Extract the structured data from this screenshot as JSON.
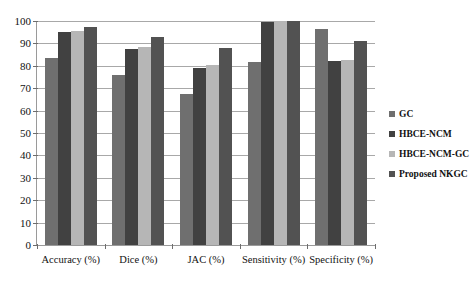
{
  "chart_data": {
    "type": "bar",
    "title": "",
    "subtitle": "",
    "xlabel": "",
    "ylabel": "",
    "ylim": [
      0,
      100
    ],
    "ytick_step": 10,
    "yticks": [
      100,
      90,
      80,
      70,
      60,
      50,
      40,
      30,
      20,
      10,
      0
    ],
    "grid": true,
    "legend_position": "right",
    "categories": [
      "Accuracy (%)",
      "Dice (%)",
      "JAC (%)",
      "Sensitivity (%)",
      "Specificity (%)"
    ],
    "series": [
      {
        "name": "GC",
        "color": "#6f6f6f",
        "values": [
          83.5,
          76.0,
          67.5,
          81.5,
          96.5
        ]
      },
      {
        "name": "HBCE-NCM",
        "color": "#414141",
        "values": [
          95.0,
          87.5,
          79.0,
          99.5,
          82.0
        ]
      },
      {
        "name": "HBCE-NCM-GC",
        "color": "#b6b6b6",
        "values": [
          95.5,
          88.5,
          80.5,
          99.8,
          82.5
        ]
      },
      {
        "name": "Proposed NKGC",
        "color": "#525252",
        "values": [
          97.5,
          93.0,
          88.0,
          99.8,
          91.0
        ]
      }
    ]
  },
  "axes": {
    "axis_line_color": "#9a9a9a",
    "gridline_color": "#a8a8a8"
  }
}
